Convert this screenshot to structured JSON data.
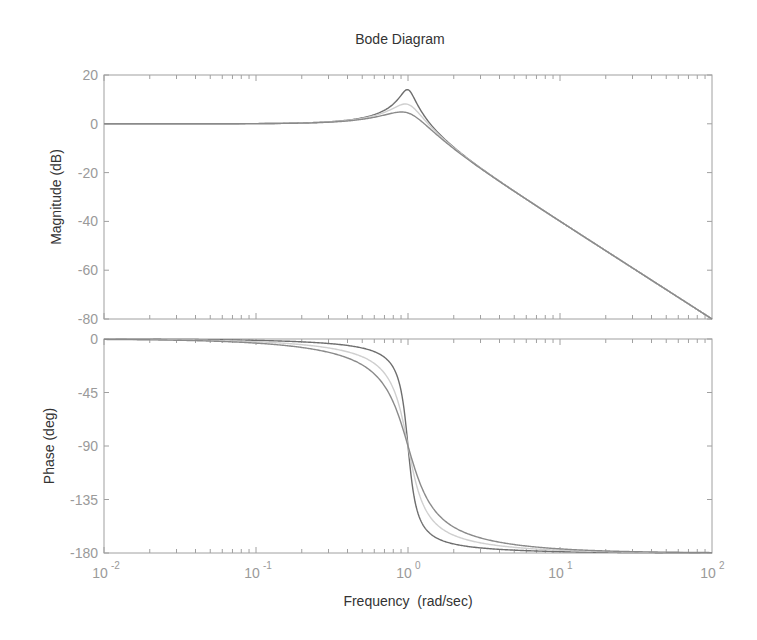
{
  "chart_data": {
    "type": "line",
    "title": "Bode Diagram",
    "xlabel": "Frequency  (rad/sec)",
    "xscale": "log",
    "xlim": [
      0.01,
      100
    ],
    "x_ticks": [
      {
        "base": "10",
        "exp": "-2",
        "value": 0.01
      },
      {
        "base": "10",
        "exp": "-1",
        "value": 0.1
      },
      {
        "base": "10",
        "exp": "0",
        "value": 1
      },
      {
        "base": "10",
        "exp": "1",
        "value": 10
      },
      {
        "base": "10",
        "exp": "2",
        "value": 100
      }
    ],
    "system": "second-order 1/(s^2 + 2*zeta*s + 1)",
    "series": [
      {
        "name": "zeta=0.1",
        "zeta": 0.1,
        "color": "#6e6e6e",
        "peak_db": 14.0
      },
      {
        "name": "zeta=0.2",
        "zeta": 0.2,
        "color": "#cfcfcf",
        "peak_db": 8.1
      },
      {
        "name": "zeta=0.3",
        "zeta": 0.3,
        "color": "#8a8a8a",
        "peak_db": 4.8
      }
    ],
    "subplots": [
      {
        "name": "magnitude",
        "ylabel": "Magnitude (dB)",
        "ylim": [
          -80,
          20
        ],
        "yticks": [
          "20",
          "0",
          "-20",
          "-40",
          "-60",
          "-80"
        ],
        "sample_points": {
          "x": [
            0.01,
            0.1,
            0.5,
            1,
            2,
            10,
            100
          ],
          "zeta=0.1": [
            0.0,
            0.1,
            2.4,
            14.0,
            -9.6,
            -40.0,
            -80.0
          ],
          "zeta=0.2": [
            0.0,
            0.1,
            2.2,
            8.0,
            -9.8,
            -40.0,
            -80.0
          ],
          "zeta=0.3": [
            0.0,
            0.1,
            1.9,
            4.4,
            -10.1,
            -40.0,
            -80.0
          ]
        }
      },
      {
        "name": "phase",
        "ylabel": "Phase (deg)",
        "ylim": [
          -180,
          0
        ],
        "yticks": [
          "0",
          "-45",
          "-90",
          "-135",
          "-180"
        ],
        "sample_points": {
          "x": [
            0.01,
            0.1,
            0.5,
            1,
            2,
            10,
            100
          ],
          "zeta=0.1": [
            -0.1,
            -1.2,
            -7.6,
            -90,
            -172.4,
            -178.8,
            -179.9
          ],
          "zeta=0.2": [
            -0.2,
            -2.3,
            -14.9,
            -90,
            -165.1,
            -177.7,
            -179.8
          ],
          "zeta=0.3": [
            -0.3,
            -3.5,
            -21.8,
            -90,
            -158.2,
            -176.5,
            -179.7
          ]
        }
      }
    ],
    "grid": false,
    "legend": "none"
  },
  "colors": {
    "axis": "#a0a0a0",
    "tick_text": "#9a9a9a",
    "label_text": "#333333"
  }
}
